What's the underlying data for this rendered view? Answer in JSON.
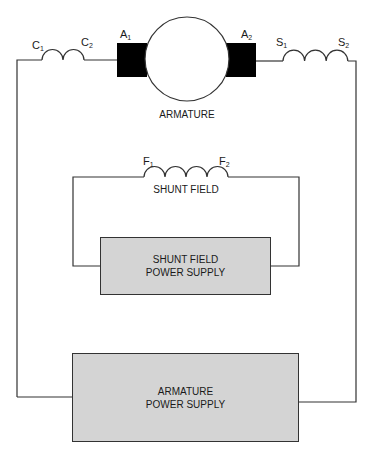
{
  "diagram": {
    "type": "compound DC motor wiring schematic",
    "colors": {
      "wire": "#333333",
      "brush": "#000000",
      "supply_fill": "#d4d4d4",
      "background": "#ffffff"
    },
    "series_field": {
      "terminal_left": "C",
      "terminal_left_sub": "1",
      "terminal_right": "C",
      "terminal_right_sub": "2"
    },
    "armature": {
      "label": "ARMATURE",
      "brush_left": "A",
      "brush_left_sub": "1",
      "brush_right": "A",
      "brush_right_sub": "2"
    },
    "interpole_field": {
      "terminal_left": "S",
      "terminal_left_sub": "1",
      "terminal_right": "S",
      "terminal_right_sub": "2"
    },
    "shunt_field": {
      "label": "SHUNT FIELD",
      "terminal_left": "F",
      "terminal_left_sub": "1",
      "terminal_right": "F",
      "terminal_right_sub": "2"
    },
    "shunt_supply": {
      "line1": "SHUNT FIELD",
      "line2": "POWER SUPPLY"
    },
    "armature_supply": {
      "line1": "ARMATURE",
      "line2": "POWER SUPPLY"
    }
  }
}
